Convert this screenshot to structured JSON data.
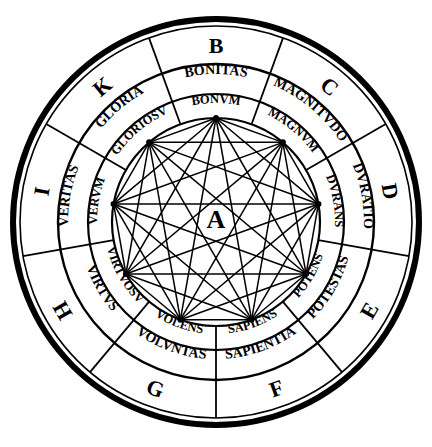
{
  "figure": {
    "center_letter": "A",
    "ink_color": "#000000",
    "background_color": "#ffffff",
    "ring_count": 3,
    "sector_count": 9,
    "inner_vertex_count": 9
  },
  "sectors": [
    {
      "letter": "B",
      "dignity": "BONITAS",
      "adjective": "BONVM",
      "angle": 0
    },
    {
      "letter": "C",
      "dignity": "MAGNITVDO",
      "adjective": "MAGNVM",
      "angle": 40
    },
    {
      "letter": "D",
      "dignity": "DVRATIO",
      "adjective": "DVRANS",
      "angle": 80
    },
    {
      "letter": "E",
      "dignity": "POTESTAS",
      "adjective": "POTENS",
      "angle": 120
    },
    {
      "letter": "F",
      "dignity": "SAPIENTIA",
      "adjective": "SAPIENS",
      "angle": 160
    },
    {
      "letter": "G",
      "dignity": "VOLVNTAS",
      "adjective": "VOLENS",
      "angle": 200
    },
    {
      "letter": "H",
      "dignity": "VIRTVS",
      "adjective": "VIRTVOSV",
      "angle": 240
    },
    {
      "letter": "I",
      "dignity": "VERITAS",
      "adjective": "VERVM",
      "angle": 280
    },
    {
      "letter": "K",
      "dignity": "GLORIA",
      "adjective": "GLORIOSV",
      "angle": 320
    }
  ],
  "geometry": {
    "center_x": 216,
    "center_y": 222,
    "r_outer_edge": 203,
    "r_ring1_outer": 196,
    "r_ring1_inner": 158,
    "r_ring2_outer": 158,
    "r_ring2_inner": 128,
    "r_ring3_outer": 128,
    "r_ring3_inner": 104,
    "r_vertex_circle": 104
  }
}
